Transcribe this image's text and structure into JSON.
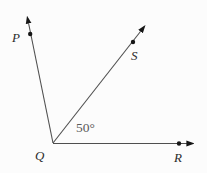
{
  "figure": {
    "type": "geometry-angle-diagram",
    "vertex_label": "Q",
    "labels": {
      "P": "P",
      "S": "S",
      "Q": "Q",
      "R": "R"
    },
    "angle": {
      "text": "50°",
      "value_degrees": 50,
      "vertex": "Q",
      "between_rays": [
        "QS",
        "QR"
      ]
    },
    "rays": [
      {
        "name": "QP",
        "from": "Q",
        "endpoint_label": "P",
        "direction": "up-left",
        "has_arrowhead": true,
        "has_point_dot": true
      },
      {
        "name": "QS",
        "from": "Q",
        "endpoint_label": "S",
        "direction": "up-right",
        "has_arrowhead": true,
        "has_point_dot": true
      },
      {
        "name": "QR",
        "from": "Q",
        "endpoint_label": "R",
        "direction": "right-horizontal",
        "has_arrowhead": true,
        "has_point_dot": true
      }
    ],
    "colors": {
      "line": "#4f4f4f",
      "point_dot": "#161616",
      "arrowhead": "#161616",
      "point_label": "#2b2b2b",
      "angle_text": "#5a5a5a",
      "background": "#fcfcfc"
    }
  }
}
